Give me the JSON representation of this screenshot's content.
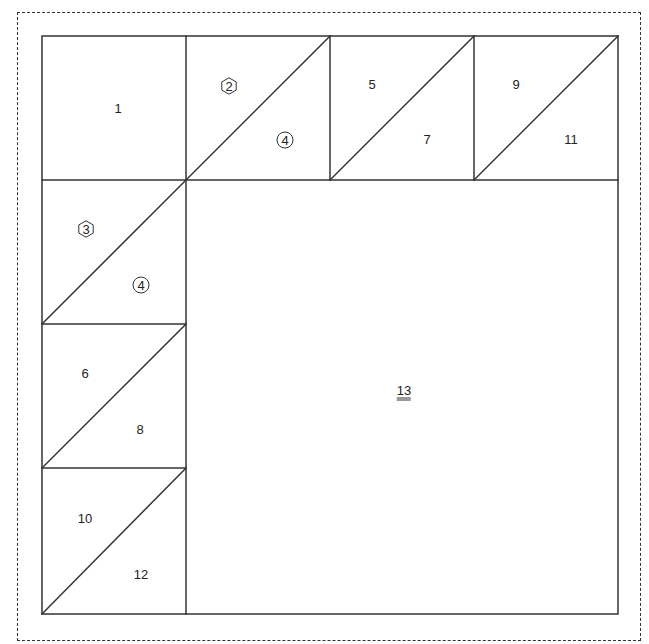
{
  "diagram": {
    "type": "quilt-block-piecing-diagram",
    "grid": {
      "cols": 4,
      "rows": 4,
      "cell_size_px": 144,
      "origin": [
        42,
        36
      ]
    },
    "line_color": "#333333",
    "pieces": [
      {
        "id": "1",
        "label": "1",
        "shape": "square",
        "cell": [
          0,
          0
        ],
        "x": 118,
        "y": 108,
        "marker": "none"
      },
      {
        "id": "2",
        "label": "2",
        "shape": "triangle",
        "cell": [
          1,
          0
        ],
        "x": 229,
        "y": 86,
        "marker": "hexagon"
      },
      {
        "id": "4a",
        "label": "4",
        "shape": "triangle",
        "cell": [
          1,
          0
        ],
        "x": 285,
        "y": 140,
        "marker": "circle"
      },
      {
        "id": "5",
        "label": "5",
        "shape": "triangle",
        "cell": [
          2,
          0
        ],
        "x": 372,
        "y": 84,
        "marker": "none"
      },
      {
        "id": "7",
        "label": "7",
        "shape": "triangle",
        "cell": [
          2,
          0
        ],
        "x": 427,
        "y": 139,
        "marker": "none"
      },
      {
        "id": "9",
        "label": "9",
        "shape": "triangle",
        "cell": [
          3,
          0
        ],
        "x": 516,
        "y": 84,
        "marker": "none"
      },
      {
        "id": "11",
        "label": "11",
        "shape": "triangle",
        "cell": [
          3,
          0
        ],
        "x": 571,
        "y": 139,
        "marker": "none"
      },
      {
        "id": "3",
        "label": "3",
        "shape": "triangle",
        "cell": [
          0,
          1
        ],
        "x": 86,
        "y": 229,
        "marker": "hexagon"
      },
      {
        "id": "4b",
        "label": "4",
        "shape": "triangle",
        "cell": [
          0,
          1
        ],
        "x": 141,
        "y": 285,
        "marker": "circle"
      },
      {
        "id": "6",
        "label": "6",
        "shape": "triangle",
        "cell": [
          0,
          2
        ],
        "x": 85,
        "y": 373,
        "marker": "none"
      },
      {
        "id": "8",
        "label": "8",
        "shape": "triangle",
        "cell": [
          0,
          2
        ],
        "x": 140,
        "y": 429,
        "marker": "none"
      },
      {
        "id": "10",
        "label": "10",
        "shape": "triangle",
        "cell": [
          0,
          3
        ],
        "x": 85,
        "y": 518,
        "marker": "none"
      },
      {
        "id": "12",
        "label": "12",
        "shape": "triangle",
        "cell": [
          0,
          3
        ],
        "x": 141,
        "y": 574,
        "marker": "none"
      },
      {
        "id": "13",
        "label": "13",
        "shape": "large-square",
        "cell": [
          1,
          1
        ],
        "x": 404,
        "y": 392,
        "marker": "double-underline"
      }
    ]
  }
}
